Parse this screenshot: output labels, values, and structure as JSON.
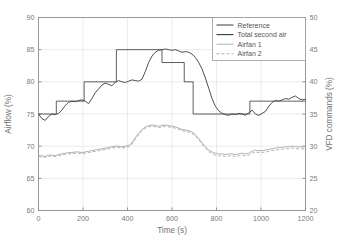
{
  "chart_data": {
    "type": "line",
    "title": "",
    "xlabel": "Time (s)",
    "ylabel": "Airflow (%)",
    "y2label": "VFD commands (%)",
    "xlim": [
      0,
      1200
    ],
    "ylim": [
      60,
      90
    ],
    "y2lim": [
      20,
      50
    ],
    "xticks": [
      0,
      200,
      400,
      600,
      800,
      1000,
      1200
    ],
    "yticks": [
      60,
      65,
      70,
      75,
      80,
      85,
      90
    ],
    "y2ticks": [
      20,
      25,
      30,
      35,
      40,
      45,
      50
    ],
    "grid": true,
    "legend_position": "top-right",
    "legend": [
      "Reference",
      "Total second air",
      "Airfan 1",
      "Airfan 2"
    ],
    "colors": {
      "reference": "#4d4d4d",
      "total_second_air": "#3a3a3a",
      "airfan1": "#a8a8a8",
      "airfan2": "#a8a8a8",
      "axis": "#8c8c8c",
      "grid": "#e2e2e2",
      "text": "#6f6f6f"
    },
    "series": [
      {
        "name": "Reference",
        "axis": "left",
        "style": "step",
        "unit": "%",
        "points": [
          [
            0,
            75
          ],
          [
            80,
            75
          ],
          [
            80,
            77
          ],
          [
            205,
            77
          ],
          [
            205,
            80
          ],
          [
            350,
            80
          ],
          [
            350,
            85
          ],
          [
            555,
            85
          ],
          [
            555,
            83
          ],
          [
            655,
            83
          ],
          [
            655,
            80
          ],
          [
            695,
            80
          ],
          [
            695,
            75
          ],
          [
            950,
            75
          ],
          [
            950,
            77
          ],
          [
            1200,
            77
          ]
        ]
      },
      {
        "name": "Total second air",
        "axis": "left",
        "style": "solid",
        "unit": "%",
        "x": [
          0,
          15,
          30,
          45,
          60,
          75,
          90,
          105,
          120,
          135,
          150,
          165,
          180,
          195,
          210,
          225,
          240,
          255,
          270,
          285,
          300,
          315,
          330,
          345,
          360,
          375,
          390,
          405,
          420,
          435,
          450,
          465,
          480,
          495,
          510,
          525,
          540,
          555,
          570,
          585,
          600,
          615,
          630,
          645,
          660,
          675,
          690,
          705,
          720,
          735,
          750,
          765,
          780,
          795,
          810,
          825,
          840,
          855,
          870,
          885,
          900,
          915,
          930,
          945,
          960,
          975,
          990,
          1005,
          1020,
          1035,
          1050,
          1065,
          1080,
          1095,
          1110,
          1125,
          1140,
          1155,
          1170,
          1185,
          1200
        ],
        "y": [
          75.0,
          74.3,
          74.0,
          74.6,
          75.0,
          74.9,
          75.1,
          75.6,
          76.3,
          76.8,
          77.0,
          76.9,
          77.1,
          77.2,
          77.0,
          76.6,
          77.4,
          78.3,
          78.9,
          79.5,
          79.8,
          79.6,
          79.4,
          79.9,
          80.2,
          80.0,
          79.9,
          80.1,
          80.3,
          80.2,
          80.1,
          80.4,
          81.6,
          83.0,
          84.0,
          84.6,
          84.9,
          85.0,
          85.1,
          85.0,
          84.9,
          85.0,
          84.8,
          84.6,
          84.7,
          84.6,
          84.3,
          83.8,
          83.0,
          82.0,
          80.6,
          79.0,
          77.4,
          76.2,
          75.5,
          75.1,
          74.9,
          74.8,
          75.0,
          74.9,
          75.1,
          75.0,
          74.8,
          75.2,
          75.6,
          75.0,
          74.8,
          75.1,
          75.4,
          76.2,
          76.8,
          77.1,
          77.0,
          77.2,
          77.4,
          77.3,
          77.6,
          77.8,
          77.4,
          77.2,
          77.3
        ]
      },
      {
        "name": "Airfan 1",
        "axis": "right",
        "style": "solid",
        "unit": "%",
        "x": [
          0,
          15,
          30,
          45,
          60,
          75,
          90,
          105,
          120,
          135,
          150,
          165,
          180,
          195,
          210,
          225,
          240,
          255,
          270,
          285,
          300,
          315,
          330,
          345,
          360,
          375,
          390,
          405,
          420,
          435,
          450,
          465,
          480,
          495,
          510,
          525,
          540,
          555,
          570,
          585,
          600,
          615,
          630,
          645,
          660,
          675,
          690,
          705,
          720,
          735,
          750,
          765,
          780,
          795,
          810,
          825,
          840,
          855,
          870,
          885,
          900,
          915,
          930,
          945,
          960,
          975,
          990,
          1005,
          1020,
          1035,
          1050,
          1065,
          1080,
          1095,
          1110,
          1125,
          1140,
          1155,
          1170,
          1185,
          1200
        ],
        "y": [
          28.5,
          28.5,
          28.4,
          28.6,
          28.6,
          28.5,
          28.7,
          28.8,
          28.9,
          29.0,
          29.0,
          29.1,
          29.1,
          29.0,
          29.1,
          29.2,
          29.3,
          29.4,
          29.5,
          29.6,
          29.7,
          29.8,
          29.9,
          30.0,
          30.0,
          29.9,
          30.0,
          30.1,
          30.5,
          31.3,
          32.0,
          32.6,
          33.0,
          33.2,
          33.3,
          33.2,
          33.1,
          33.2,
          33.3,
          33.2,
          33.1,
          33.0,
          32.8,
          32.6,
          32.5,
          32.4,
          32.2,
          31.8,
          31.2,
          30.5,
          29.9,
          29.4,
          29.1,
          28.9,
          28.8,
          28.8,
          28.7,
          28.8,
          28.8,
          28.7,
          28.8,
          28.9,
          28.8,
          28.9,
          29.2,
          29.4,
          29.3,
          29.3,
          29.4,
          29.5,
          29.6,
          29.7,
          29.8,
          29.8,
          29.9,
          29.9,
          30.0,
          29.9,
          29.9,
          29.9,
          29.9
        ]
      },
      {
        "name": "Airfan 2",
        "axis": "right",
        "style": "dashed",
        "unit": "%",
        "x": [
          0,
          15,
          30,
          45,
          60,
          75,
          90,
          105,
          120,
          135,
          150,
          165,
          180,
          195,
          210,
          225,
          240,
          255,
          270,
          285,
          300,
          315,
          330,
          345,
          360,
          375,
          390,
          405,
          420,
          435,
          450,
          465,
          480,
          495,
          510,
          525,
          540,
          555,
          570,
          585,
          600,
          615,
          630,
          645,
          660,
          675,
          690,
          705,
          720,
          735,
          750,
          765,
          780,
          795,
          810,
          825,
          840,
          855,
          870,
          885,
          900,
          915,
          930,
          945,
          960,
          975,
          990,
          1005,
          1020,
          1035,
          1050,
          1065,
          1080,
          1095,
          1110,
          1125,
          1140,
          1155,
          1170,
          1185,
          1200
        ],
        "y": [
          28.4,
          28.3,
          28.3,
          28.4,
          28.5,
          28.4,
          28.5,
          28.6,
          28.7,
          28.8,
          28.8,
          28.9,
          28.9,
          28.8,
          28.9,
          29.0,
          29.1,
          29.2,
          29.3,
          29.4,
          29.5,
          29.6,
          29.7,
          29.8,
          29.8,
          29.7,
          29.8,
          29.9,
          30.3,
          31.1,
          31.8,
          32.4,
          32.8,
          33.0,
          33.1,
          33.0,
          32.9,
          33.0,
          33.1,
          33.0,
          32.9,
          32.8,
          32.6,
          32.4,
          32.3,
          32.2,
          32.0,
          31.6,
          31.0,
          30.3,
          29.7,
          29.2,
          28.8,
          28.6,
          28.5,
          28.5,
          28.4,
          28.5,
          28.5,
          28.4,
          28.5,
          28.6,
          28.5,
          28.6,
          28.9,
          29.1,
          29.0,
          29.0,
          29.1,
          29.2,
          29.3,
          29.4,
          29.5,
          29.5,
          29.6,
          29.6,
          29.7,
          29.6,
          29.6,
          29.6,
          29.6
        ]
      }
    ]
  }
}
